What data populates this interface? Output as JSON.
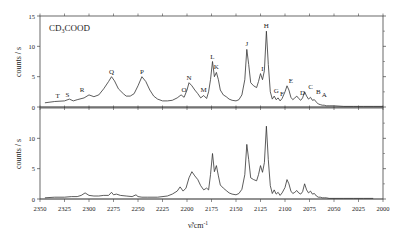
{
  "chart_data": [
    {
      "type": "line",
      "panel": "top",
      "title": "CD3COOD",
      "xlabel": "ν̃/cm⁻¹",
      "ylabel": "counts / s",
      "xlim": [
        2350,
        2000
      ],
      "ylim": [
        0,
        15
      ],
      "yticks": [
        0,
        5,
        10,
        15
      ],
      "grid": false,
      "series": [
        {
          "name": "CD3COOD spectrum",
          "x": [
            2345,
            2335,
            2325,
            2320,
            2316,
            2312,
            2305,
            2300,
            2295,
            2290,
            2285,
            2280,
            2277,
            2274,
            2270,
            2265,
            2262,
            2258,
            2254,
            2250,
            2246,
            2242,
            2238,
            2234,
            2230,
            2225,
            2220,
            2215,
            2210,
            2206,
            2203,
            2200,
            2198,
            2195,
            2192,
            2189,
            2186,
            2183,
            2180,
            2178,
            2176,
            2174,
            2172,
            2170,
            2168,
            2166,
            2163,
            2160,
            2157,
            2154,
            2150,
            2147,
            2144,
            2141,
            2139,
            2137,
            2135,
            2132,
            2129,
            2127,
            2125,
            2123,
            2121,
            2119,
            2117,
            2115,
            2113,
            2111,
            2109,
            2107,
            2105,
            2103,
            2100,
            2098,
            2096,
            2094,
            2092,
            2090,
            2088,
            2086,
            2084,
            2082,
            2080,
            2078,
            2076,
            2074,
            2072,
            2070,
            2068,
            2066,
            2064,
            2062,
            2060,
            2058,
            2055,
            2050,
            2040,
            2030,
            2020,
            2010,
            2000
          ],
          "y": [
            0.7,
            0.9,
            1.0,
            1.3,
            1.0,
            1.2,
            1.5,
            2.0,
            1.7,
            2.0,
            3.0,
            4.2,
            5.0,
            4.3,
            3.0,
            2.2,
            1.8,
            1.8,
            2.2,
            3.5,
            5.0,
            4.2,
            2.8,
            1.8,
            1.3,
            1.0,
            1.0,
            1.1,
            1.5,
            2.0,
            1.6,
            2.8,
            4.0,
            3.5,
            2.8,
            2.2,
            1.5,
            1.9,
            1.4,
            2.5,
            4.5,
            7.5,
            5.0,
            5.7,
            4.5,
            2.8,
            2.0,
            1.7,
            1.3,
            1.1,
            1.0,
            1.2,
            2.0,
            4.5,
            9.5,
            7.0,
            4.0,
            3.5,
            3.2,
            4.2,
            5.5,
            4.5,
            6.0,
            12.5,
            7.0,
            2.5,
            1.3,
            1.8,
            1.2,
            1.5,
            1.0,
            1.4,
            2.5,
            3.5,
            2.8,
            1.6,
            1.2,
            1.5,
            1.8,
            1.4,
            1.1,
            1.5,
            2.5,
            1.8,
            1.3,
            1.6,
            1.1,
            1.2,
            0.8,
            0.5,
            0.4,
            0.3,
            0.3,
            0.2,
            0.2,
            0.2,
            0.1,
            0.1,
            0.1,
            0.1,
            0.1
          ]
        }
      ],
      "peak_labels": [
        {
          "label": "T",
          "x": 2332,
          "y": 1.0
        },
        {
          "label": "S",
          "x": 2322,
          "y": 1.1
        },
        {
          "label": "R",
          "x": 2307,
          "y": 2.0
        },
        {
          "label": "Q",
          "x": 2277,
          "y": 5.0
        },
        {
          "label": "P",
          "x": 2246,
          "y": 5.0
        },
        {
          "label": "O",
          "x": 2203,
          "y": 2.0
        },
        {
          "label": "N",
          "x": 2198,
          "y": 4.0
        },
        {
          "label": "M",
          "x": 2183,
          "y": 1.9
        },
        {
          "label": "L",
          "x": 2174,
          "y": 7.5
        },
        {
          "label": "K",
          "x": 2170,
          "y": 5.7
        },
        {
          "label": "J",
          "x": 2139,
          "y": 9.5
        },
        {
          "label": "I",
          "x": 2123,
          "y": 5.5
        },
        {
          "label": "H",
          "x": 2119,
          "y": 12.5
        },
        {
          "label": "G",
          "x": 2109,
          "y": 1.8
        },
        {
          "label": "F",
          "x": 2103,
          "y": 1.4
        },
        {
          "label": "E",
          "x": 2094,
          "y": 3.5
        },
        {
          "label": "D",
          "x": 2082,
          "y": 1.5
        },
        {
          "label": "C",
          "x": 2074,
          "y": 2.5
        },
        {
          "label": "B",
          "x": 2066,
          "y": 1.6
        },
        {
          "label": "A",
          "x": 2060,
          "y": 1.2
        }
      ]
    },
    {
      "type": "line",
      "panel": "bottom",
      "xlabel": "ν̃/cm⁻¹",
      "ylabel": "counts / s",
      "xlim": [
        2350,
        2000
      ],
      "ylim": [
        0,
        15
      ],
      "yticks": [
        0,
        5,
        10
      ],
      "xticks": [
        2350,
        2325,
        2300,
        2275,
        2250,
        2225,
        2200,
        2175,
        2150,
        2125,
        2100,
        2075,
        2050,
        2025,
        2000
      ],
      "grid": false,
      "series": [
        {
          "name": "spectrum 2",
          "x": [
            2345,
            2335,
            2325,
            2318,
            2312,
            2308,
            2304,
            2300,
            2295,
            2290,
            2285,
            2280,
            2277,
            2275,
            2272,
            2268,
            2262,
            2256,
            2252,
            2250,
            2246,
            2240,
            2230,
            2220,
            2215,
            2210,
            2207,
            2204,
            2201,
            2198,
            2195,
            2192,
            2189,
            2186,
            2183,
            2180,
            2178,
            2176,
            2174,
            2172,
            2170,
            2168,
            2166,
            2163,
            2160,
            2157,
            2154,
            2150,
            2147,
            2144,
            2141,
            2139,
            2137,
            2135,
            2132,
            2129,
            2127,
            2125,
            2123,
            2121,
            2119,
            2117,
            2115,
            2113,
            2111,
            2109,
            2107,
            2105,
            2103,
            2100,
            2098,
            2096,
            2094,
            2092,
            2090,
            2088,
            2086,
            2084,
            2082,
            2080,
            2078,
            2076,
            2074,
            2072,
            2070,
            2068,
            2066,
            2064,
            2062,
            2060,
            2058,
            2055,
            2050,
            2040,
            2030,
            2020,
            2010,
            2000
          ],
          "y": [
            0.2,
            0.3,
            0.3,
            0.4,
            0.4,
            0.6,
            1.0,
            0.6,
            0.5,
            0.5,
            0.6,
            0.6,
            1.1,
            0.7,
            0.8,
            0.6,
            0.5,
            0.4,
            0.7,
            0.4,
            0.3,
            0.3,
            0.3,
            0.5,
            0.8,
            1.3,
            2.0,
            1.3,
            1.8,
            3.5,
            4.5,
            3.8,
            3.2,
            2.2,
            1.5,
            1.8,
            1.5,
            4.0,
            7.5,
            4.5,
            5.5,
            3.8,
            2.3,
            1.8,
            1.4,
            1.0,
            0.8,
            0.7,
            0.9,
            1.6,
            4.0,
            9.0,
            6.5,
            3.5,
            3.2,
            3.0,
            4.0,
            5.5,
            4.4,
            6.0,
            12.0,
            6.5,
            2.2,
            0.9,
            1.5,
            0.8,
            1.1,
            0.6,
            1.0,
            1.9,
            3.2,
            2.5,
            1.3,
            0.9,
            1.1,
            1.4,
            1.0,
            0.8,
            1.2,
            2.5,
            1.5,
            1.0,
            1.3,
            0.8,
            0.9,
            0.5,
            0.3,
            0.3,
            0.2,
            0.2,
            0.2,
            0.1,
            0.1,
            0.1,
            0.1,
            0.1,
            0.1
          ]
        }
      ]
    }
  ],
  "labels": {
    "molecule_title": "CD",
    "molecule_sub": "3",
    "molecule_rest": "COOD",
    "ylabel_top": "counts / s",
    "ylabel_bottom": "counts / s",
    "xlabel_main": "ν̃/cm",
    "xlabel_sup": "-1"
  }
}
